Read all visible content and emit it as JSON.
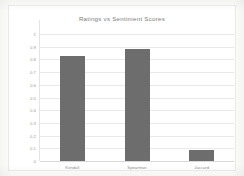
{
  "chart_data": {
    "type": "bar",
    "title": "Ratings vs Sentiment Scores",
    "categories": [
      "Kendall",
      "Spearman",
      "Jaccard"
    ],
    "values": [
      0.83,
      0.88,
      0.09
    ],
    "xlabel": "",
    "ylabel": "",
    "ylim": [
      0,
      1
    ],
    "ytick_labels": [
      "1",
      "0.9",
      "0.8",
      "0.7",
      "0.6",
      "0.5",
      "0.4",
      "0.3",
      "0.2",
      "0.1",
      "0"
    ],
    "ytick_values": [
      1,
      0.9,
      0.8,
      0.7,
      0.6,
      0.5,
      0.4,
      0.3,
      0.2,
      0.1,
      0
    ],
    "grid": true,
    "legend": false,
    "legend_position": "none",
    "bar_color": "#6d6d6d",
    "gridline_color": "#e9e9e9",
    "title_color": "#7d7d7d",
    "tick_label_color": "#9a9a9a",
    "plot_background": "#ffffff",
    "page_background": "#fdfdfc"
  }
}
